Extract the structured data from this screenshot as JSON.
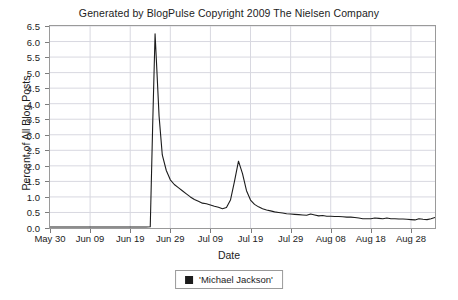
{
  "chart_data": {
    "type": "line",
    "title": "Generated by BlogPulse Copyright 2009 The Nielsen Company",
    "xlabel": "Date",
    "ylabel": "Percent of All Blog Posts",
    "grid": true,
    "legend_position": "bottom-center",
    "ylim": [
      0.0,
      6.5
    ],
    "yticks": [
      "0.0",
      "0.5",
      "1.0",
      "1.5",
      "2.0",
      "2.5",
      "3.0",
      "3.5",
      "4.0",
      "4.5",
      "5.0",
      "5.5",
      "6.0",
      "6.5"
    ],
    "ytick_values": [
      0.0,
      0.5,
      1.0,
      1.5,
      2.0,
      2.5,
      3.0,
      3.5,
      4.0,
      4.5,
      5.0,
      5.5,
      6.0,
      6.5
    ],
    "xticks": [
      "May 30",
      "Jun 09",
      "Jun 19",
      "Jun 29",
      "Jul 09",
      "Jul 19",
      "Jul 29",
      "Aug 08",
      "Aug 18",
      "Aug 28"
    ],
    "xtick_days": [
      0,
      10,
      20,
      30,
      40,
      50,
      60,
      70,
      80,
      90
    ],
    "xlim_days": [
      0,
      96
    ],
    "series": [
      {
        "name": "'Michael Jackson'",
        "color": "#1c1c1c",
        "x_days": [
          0,
          2,
          4,
          6,
          8,
          10,
          12,
          14,
          16,
          18,
          20,
          22,
          24,
          25,
          25.6,
          26.2,
          26.6,
          27.2,
          28,
          29,
          30,
          31,
          32,
          33,
          34,
          35,
          36,
          37,
          38,
          39,
          40,
          41,
          42,
          43,
          44,
          45,
          46,
          47,
          48,
          49,
          50,
          51,
          52,
          53,
          54,
          55,
          56,
          57,
          58,
          59,
          60,
          61,
          62,
          63,
          64,
          65,
          66,
          67,
          68,
          69,
          70,
          71,
          72,
          73,
          74,
          75,
          76,
          77,
          78,
          79,
          80,
          81,
          82,
          83,
          84,
          85,
          86,
          87,
          88,
          89,
          90,
          91,
          92,
          93,
          94,
          95,
          96
        ],
        "values": [
          0.03,
          0.03,
          0.03,
          0.03,
          0.03,
          0.03,
          0.03,
          0.03,
          0.03,
          0.03,
          0.03,
          0.03,
          0.03,
          0.04,
          3.3,
          6.25,
          5.2,
          3.6,
          2.35,
          1.85,
          1.55,
          1.4,
          1.3,
          1.2,
          1.1,
          1.0,
          0.92,
          0.86,
          0.8,
          0.78,
          0.74,
          0.7,
          0.67,
          0.62,
          0.66,
          0.9,
          1.5,
          2.15,
          1.75,
          1.2,
          0.9,
          0.76,
          0.68,
          0.62,
          0.58,
          0.55,
          0.52,
          0.5,
          0.48,
          0.46,
          0.45,
          0.44,
          0.43,
          0.42,
          0.41,
          0.45,
          0.42,
          0.39,
          0.4,
          0.38,
          0.38,
          0.37,
          0.37,
          0.36,
          0.35,
          0.35,
          0.34,
          0.32,
          0.3,
          0.3,
          0.3,
          0.32,
          0.31,
          0.3,
          0.32,
          0.3,
          0.3,
          0.29,
          0.29,
          0.28,
          0.27,
          0.26,
          0.3,
          0.28,
          0.27,
          0.3,
          0.34,
          0.3,
          0.28,
          0.28,
          0.28,
          0.28,
          0.3,
          0.5,
          0.42,
          0.32,
          0.3,
          0.3,
          0.3,
          0.3,
          0.29
        ]
      }
    ]
  },
  "colors": {
    "line": "#1c1c1c",
    "grid": "#d8d8e0",
    "frame": "#9a9a9a",
    "text": "#1c1c1c",
    "background": "#ffffff"
  }
}
